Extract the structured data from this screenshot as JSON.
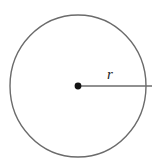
{
  "figure": {
    "name": "circle-with-radius",
    "caption": "",
    "background_color": "#ffffff"
  },
  "geometry": {
    "circle": {
      "center_x": 78,
      "center_y": 86,
      "radius_x": 68,
      "radius_y": 71,
      "stroke_color": "#6b6b6b",
      "stroke_width": 1.4,
      "fill": "none"
    },
    "center_point": {
      "x": 78,
      "y": 86,
      "radius": 3.4,
      "color": "#141414"
    },
    "radius_segment": {
      "x1": 78,
      "y1": 86,
      "x2": 152,
      "y2": 86,
      "stroke_color": "#6b6b6b",
      "stroke_width": 1.4
    }
  },
  "labels": {
    "radius": {
      "text": "r",
      "x": 110,
      "y": 79,
      "color": "#1c1c1c",
      "font_size": 15,
      "style": "italic-serif"
    }
  }
}
